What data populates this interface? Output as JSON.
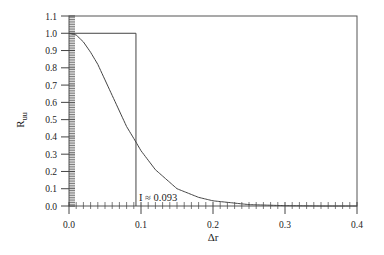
{
  "chart_data": {
    "type": "line",
    "title": "",
    "xlabel": "Δr",
    "ylabel": "R_uu",
    "ylabel_main": "R",
    "ylabel_sub": "uu",
    "xlim": [
      0.0,
      0.4
    ],
    "ylim": [
      0.0,
      1.1
    ],
    "x_ticks": [
      "0.0",
      "0.1",
      "0.2",
      "0.3",
      "0.4"
    ],
    "y_ticks": [
      "0.0",
      "0.1",
      "0.2",
      "0.3",
      "0.4",
      "0.5",
      "0.6",
      "0.7",
      "0.8",
      "0.9",
      "1.0",
      "1.1"
    ],
    "grid": false,
    "legend": null,
    "series": [
      {
        "name": "R_uu correlation",
        "x": [
          0.0,
          0.01,
          0.02,
          0.03,
          0.04,
          0.05,
          0.06,
          0.07,
          0.08,
          0.093,
          0.1,
          0.12,
          0.15,
          0.18,
          0.2,
          0.25,
          0.3,
          0.35,
          0.4
        ],
        "y": [
          1.0,
          0.99,
          0.95,
          0.89,
          0.82,
          0.73,
          0.64,
          0.55,
          0.46,
          0.37,
          0.32,
          0.21,
          0.1,
          0.05,
          0.03,
          0.008,
          0.002,
          0.0,
          0.0
        ]
      },
      {
        "name": "Equivalent rectangle (integral scale)",
        "x": [
          0.0,
          0.093,
          0.093
        ],
        "y": [
          1.0,
          1.0,
          0.0
        ]
      }
    ],
    "annotations": [
      {
        "text": "I ≈ 0.093",
        "x": 0.095,
        "y": 0.05
      }
    ]
  },
  "labels": {
    "annotation": "I ≈ 0.093",
    "xlabel": "Δr",
    "ylabel_main": "R",
    "ylabel_sub": "uu"
  }
}
